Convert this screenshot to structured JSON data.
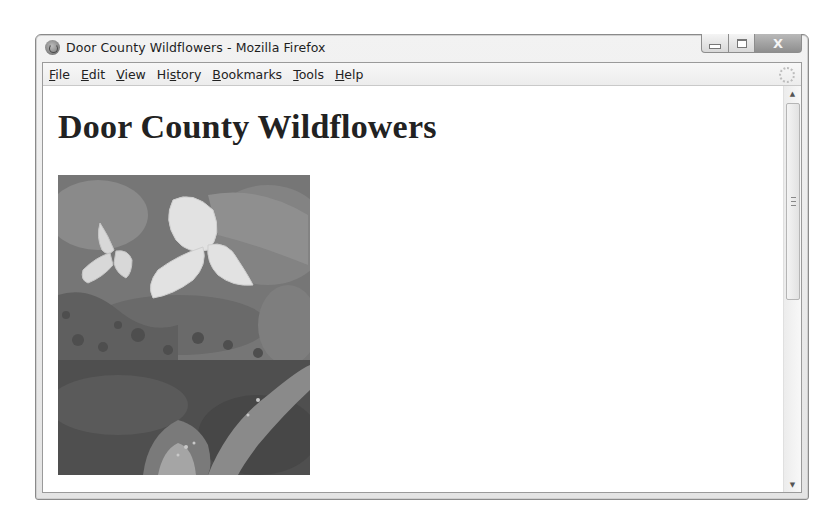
{
  "window": {
    "title": "Door County Wildflowers - Mozilla Firefox",
    "controls": {
      "minimize": "minimize",
      "maximize": "maximize",
      "close": "X"
    }
  },
  "menubar": {
    "items": [
      {
        "label": "File",
        "accel": "F",
        "rest": "ile"
      },
      {
        "label": "Edit",
        "accel": "E",
        "rest": "dit"
      },
      {
        "label": "View",
        "accel": "V",
        "rest": "iew"
      },
      {
        "label": "History",
        "pre": "Hi",
        "accel": "s",
        "rest": "tory"
      },
      {
        "label": "Bookmarks",
        "accel": "B",
        "rest": "ookmarks"
      },
      {
        "label": "Tools",
        "accel": "T",
        "rest": "ools"
      },
      {
        "label": "Help",
        "accel": "H",
        "rest": "elp"
      }
    ]
  },
  "page": {
    "heading": "Door County Wildflowers",
    "image": {
      "subject": "white trillium flowers over dark foliage, with a second photo of a lady's slipper orchid below",
      "icon": "photo"
    }
  },
  "scrollbar": {
    "up": "▲",
    "down": "▼"
  }
}
